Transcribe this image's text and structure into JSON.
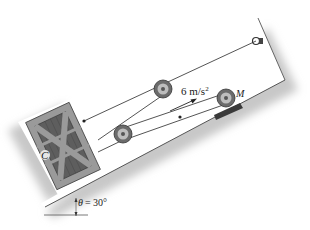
{
  "diagram": {
    "type": "mechanics-pulley-incline",
    "labels": {
      "acceleration": "6 m/s",
      "acceleration_exp": "2",
      "motor": "M",
      "crate": "C",
      "angle_symbol": "θ",
      "angle_value": "= 30°"
    },
    "colors": {
      "incline_fill": "#ffffff",
      "shadow": "#c8c8c8",
      "crate_frame": "#9a9a9a",
      "crate_panel": "#5e5e5e",
      "cable": "#555555",
      "pulley_outer": "#6b6b6b",
      "pulley_inner": "#bdbdbd",
      "motor_base": "#3a3a3a"
    }
  }
}
